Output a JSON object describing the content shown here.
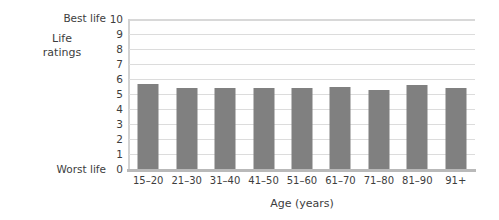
{
  "chart_data": {
    "type": "bar",
    "title": "",
    "xlabel": "Age (years)",
    "ylabel": "Life ratings",
    "categories": [
      "15–20",
      "21–30",
      "31–40",
      "41–50",
      "51–60",
      "61–70",
      "71–80",
      "81–90",
      "91+"
    ],
    "values": [
      5.65,
      5.4,
      5.4,
      5.4,
      5.4,
      5.45,
      5.3,
      5.6,
      5.4
    ],
    "ylim": [
      0,
      10
    ],
    "ytick_labels": [
      "10",
      "9",
      "8",
      "7",
      "6",
      "5",
      "4",
      "3",
      "2",
      "1",
      "0"
    ],
    "ytick_values": [
      10,
      9,
      8,
      7,
      6,
      5,
      4,
      3,
      2,
      1,
      0
    ],
    "y_axis_endpoint_labels": {
      "top": "Best life",
      "bottom": "Worst life"
    },
    "grid": true,
    "legend": null,
    "bar_color": "#808080",
    "gridline_color": "#dcdcdc",
    "axis_color": "#b9b9b9"
  },
  "axis": {
    "y_title_line1": "Life",
    "y_title_line2": "ratings",
    "x_title": "Age (years)",
    "best_life": "Best life",
    "worst_life": "Worst life"
  }
}
